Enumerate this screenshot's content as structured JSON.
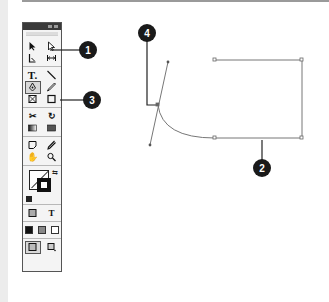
{
  "figure": {
    "type": "annotated-toolbox-and-path-diagram",
    "callouts": [
      {
        "id": "1",
        "label": "1",
        "target": "selection-tools"
      },
      {
        "id": "2",
        "label": "2",
        "target": "path-segment"
      },
      {
        "id": "3",
        "label": "3",
        "target": "pen-tool"
      },
      {
        "id": "4",
        "label": "4",
        "target": "anchor-point-with-direction-handle"
      }
    ]
  },
  "toolbox": {
    "title_buttons": [
      "collapse",
      "close"
    ],
    "groups": [
      {
        "rows": [
          [
            {
              "name": "selection-tool",
              "glyph": "arrow"
            },
            {
              "name": "direct-selection-tool",
              "glyph": "hollow-arrow"
            }
          ],
          [
            {
              "name": "page-tool",
              "glyph": "page"
            },
            {
              "name": "gap-tool",
              "glyph": "gap"
            }
          ]
        ]
      },
      {
        "rows": [
          [
            {
              "name": "type-tool",
              "glyph": "T."
            },
            {
              "name": "line-tool",
              "glyph": "line"
            }
          ],
          [
            {
              "name": "pen-tool",
              "glyph": "pen",
              "selected": true
            },
            {
              "name": "pencil-tool",
              "glyph": "pencil"
            }
          ],
          [
            {
              "name": "rectangle-frame-tool",
              "glyph": "x-box"
            },
            {
              "name": "rectangle-tool",
              "glyph": "box"
            }
          ]
        ]
      },
      {
        "rows": [
          [
            {
              "name": "scissors-tool",
              "glyph": "scissors"
            },
            {
              "name": "rotate-tool",
              "glyph": "rotate"
            }
          ],
          [
            {
              "name": "gradient-swatch-tool",
              "glyph": "gradient"
            },
            {
              "name": "gradient-feather-tool",
              "glyph": "feather"
            }
          ]
        ]
      },
      {
        "rows": [
          [
            {
              "name": "note-tool",
              "glyph": "note"
            },
            {
              "name": "eyedropper-tool",
              "glyph": "eyedropper"
            }
          ],
          [
            {
              "name": "hand-tool",
              "glyph": "hand"
            },
            {
              "name": "zoom-tool",
              "glyph": "magnifier"
            }
          ]
        ]
      }
    ],
    "fill_stroke": {
      "fill": "none",
      "stroke": "#111111"
    },
    "format_row": [
      {
        "name": "formatting-container",
        "glyph": "box"
      },
      {
        "name": "formatting-text",
        "glyph": "T"
      }
    ],
    "apply_row": [
      {
        "name": "apply-color",
        "color": "#111111"
      },
      {
        "name": "apply-gradient",
        "color": "#888888"
      },
      {
        "name": "apply-none",
        "color": "none"
      }
    ],
    "view_row": [
      {
        "name": "normal-view",
        "selected": true
      },
      {
        "name": "preview-view"
      }
    ]
  },
  "colors": {
    "callout_fill": "#1a1a1a",
    "callout_text": "#ffffff",
    "path_stroke": "#777777",
    "leader_line": "#222222",
    "toolbox_border": "#555555",
    "toolbox_bg": "#f4f4f4"
  }
}
